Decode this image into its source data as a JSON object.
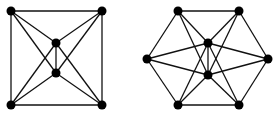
{
  "diagram": {
    "graphs": [
      {
        "name": "square-graph",
        "nodes": [
          {
            "id": "a",
            "x": 11,
            "y": 11
          },
          {
            "id": "b",
            "x": 102,
            "y": 11
          },
          {
            "id": "c",
            "x": 11,
            "y": 105
          },
          {
            "id": "d",
            "x": 102,
            "y": 105
          },
          {
            "id": "e",
            "x": 56,
            "y": 43
          },
          {
            "id": "f",
            "x": 56,
            "y": 73
          }
        ],
        "edges": [
          [
            "a",
            "b"
          ],
          [
            "b",
            "d"
          ],
          [
            "d",
            "c"
          ],
          [
            "c",
            "a"
          ],
          [
            "a",
            "e"
          ],
          [
            "a",
            "f"
          ],
          [
            "b",
            "e"
          ],
          [
            "b",
            "f"
          ],
          [
            "c",
            "e"
          ],
          [
            "c",
            "f"
          ],
          [
            "d",
            "e"
          ],
          [
            "d",
            "f"
          ],
          [
            "e",
            "f"
          ]
        ]
      },
      {
        "name": "hexagon-graph",
        "nodes": [
          {
            "id": "p",
            "x": 178,
            "y": 11
          },
          {
            "id": "q",
            "x": 239,
            "y": 11
          },
          {
            "id": "r",
            "x": 147,
            "y": 59
          },
          {
            "id": "s",
            "x": 268,
            "y": 59
          },
          {
            "id": "t",
            "x": 178,
            "y": 105
          },
          {
            "id": "u",
            "x": 239,
            "y": 105
          },
          {
            "id": "v",
            "x": 208,
            "y": 43
          },
          {
            "id": "w",
            "x": 208,
            "y": 75
          }
        ],
        "edges": [
          [
            "p",
            "q"
          ],
          [
            "q",
            "s"
          ],
          [
            "s",
            "u"
          ],
          [
            "u",
            "t"
          ],
          [
            "t",
            "r"
          ],
          [
            "r",
            "p"
          ],
          [
            "p",
            "v"
          ],
          [
            "p",
            "w"
          ],
          [
            "q",
            "v"
          ],
          [
            "q",
            "w"
          ],
          [
            "r",
            "v"
          ],
          [
            "r",
            "w"
          ],
          [
            "s",
            "v"
          ],
          [
            "s",
            "w"
          ],
          [
            "t",
            "v"
          ],
          [
            "t",
            "w"
          ],
          [
            "u",
            "v"
          ],
          [
            "u",
            "w"
          ],
          [
            "v",
            "w"
          ]
        ]
      }
    ],
    "node_radius": 4.5,
    "colors": {
      "edge": "#111111",
      "node": "#000000",
      "background": "#ffffff"
    }
  }
}
